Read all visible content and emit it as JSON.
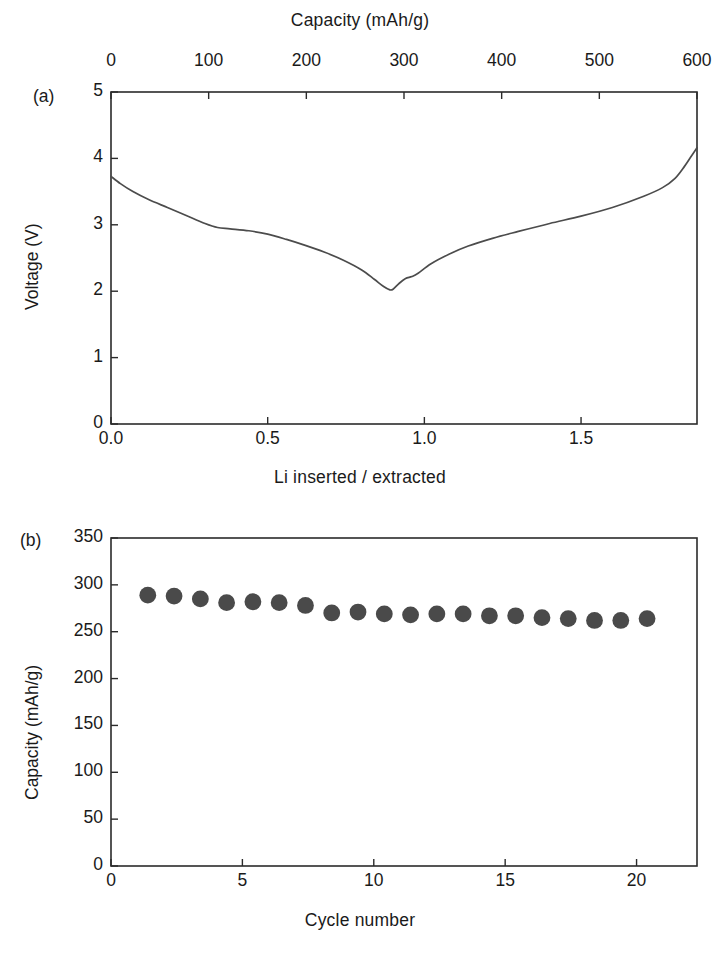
{
  "figure": {
    "background_color": "#ffffff",
    "axis_color": "#2b2b2b",
    "curve_color": "#4c4c4c",
    "marker_color": "#4a4a4a"
  },
  "panel_a": {
    "label": "(a)",
    "top_axis_title": "Capacity (mAh/g)",
    "bottom_axis_title": "Li inserted / extracted",
    "y_axis_title": "Voltage (V)",
    "top_ticks": [
      "0",
      "100",
      "200",
      "300",
      "400",
      "500",
      "600"
    ],
    "bottom_ticks": [
      "0.0",
      "0.5",
      "1.0",
      "1.5"
    ],
    "y_ticks": [
      "0",
      "1",
      "2",
      "3",
      "4",
      "5"
    ]
  },
  "panel_b": {
    "label": "(b)",
    "x_axis_title": "Cycle number",
    "y_axis_title": "Capacity (mAh/g)",
    "x_ticks": [
      "0",
      "5",
      "10",
      "15",
      "20"
    ],
    "y_ticks": [
      "0",
      "50",
      "100",
      "150",
      "200",
      "250",
      "300",
      "350"
    ]
  },
  "chart_data": [
    {
      "type": "line",
      "panel": "(a)",
      "title": "",
      "xlabel": "Li inserted / extracted",
      "ylabel": "Voltage (V)",
      "x2label": "Capacity (mAh/g)",
      "xlim": [
        0.0,
        1.87
      ],
      "ylim": [
        0,
        5
      ],
      "x2lim": [
        0,
        600
      ],
      "xticks": [
        0.0,
        0.5,
        1.0,
        1.5
      ],
      "yticks": [
        0,
        1,
        2,
        3,
        4,
        5
      ],
      "x2ticks": [
        0,
        100,
        200,
        300,
        400,
        500,
        600
      ],
      "grid": false,
      "legend": "none",
      "series": [
        {
          "name": "Discharge / charge voltage curve",
          "x": [
            0.0,
            0.03,
            0.07,
            0.12,
            0.18,
            0.24,
            0.3,
            0.34,
            0.38,
            0.44,
            0.5,
            0.56,
            0.62,
            0.68,
            0.74,
            0.8,
            0.84,
            0.87,
            0.89,
            0.9,
            0.92,
            0.94,
            0.96,
            0.98,
            1.02,
            1.08,
            1.14,
            1.22,
            1.3,
            1.4,
            1.5,
            1.6,
            1.7,
            1.76,
            1.8,
            1.83,
            1.85,
            1.87
          ],
          "y": [
            3.73,
            3.62,
            3.5,
            3.38,
            3.26,
            3.14,
            3.02,
            2.96,
            2.94,
            2.91,
            2.86,
            2.78,
            2.69,
            2.59,
            2.47,
            2.32,
            2.18,
            2.07,
            2.02,
            2.03,
            2.12,
            2.19,
            2.22,
            2.27,
            2.41,
            2.56,
            2.68,
            2.8,
            2.9,
            3.02,
            3.13,
            3.26,
            3.43,
            3.56,
            3.7,
            3.88,
            4.02,
            4.16
          ]
        }
      ]
    },
    {
      "type": "scatter",
      "panel": "(b)",
      "title": "",
      "xlabel": "Cycle number",
      "ylabel": "Capacity (mAh/g)",
      "xlim": [
        0,
        22.3
      ],
      "ylim": [
        0,
        350
      ],
      "xticks": [
        0,
        5,
        10,
        15,
        20
      ],
      "yticks": [
        0,
        50,
        100,
        150,
        200,
        250,
        300,
        350
      ],
      "grid": false,
      "legend": "none",
      "marker": "filled-circle",
      "series": [
        {
          "name": "Discharge capacity vs cycle",
          "x": [
            1.4,
            2.4,
            3.4,
            4.4,
            5.4,
            6.4,
            7.4,
            8.4,
            9.4,
            10.4,
            11.4,
            12.4,
            13.4,
            14.4,
            15.4,
            16.4,
            17.4,
            18.4,
            19.4,
            20.4
          ],
          "y": [
            289,
            288,
            285,
            281,
            282,
            281,
            278,
            270,
            271,
            269,
            268,
            269,
            269,
            267,
            267,
            265,
            264,
            262,
            262,
            264
          ]
        }
      ]
    }
  ]
}
